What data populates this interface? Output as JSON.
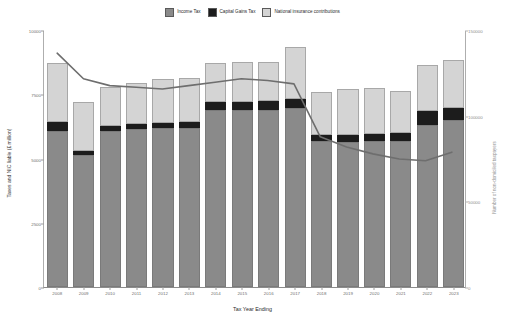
{
  "chart_data": {
    "type": "bar",
    "title": "",
    "subtitle": "",
    "xlabel": "Tax Year Ending",
    "ylabel": "Taxes and NIC liable (£ million)",
    "ylabel_right": "Number of non-domiciled taxpayers",
    "grid": false,
    "legend_position": "top-center",
    "categories": [
      "2008",
      "2009",
      "2010",
      "2011",
      "2012",
      "2013",
      "2014",
      "2015",
      "2016",
      "2017",
      "2018",
      "2019",
      "2020",
      "2021",
      "2022",
      "2023"
    ],
    "ylim": [
      0,
      10000
    ],
    "yticks": [
      0,
      2500,
      5000,
      7500,
      10000
    ],
    "ytick_labels": [
      "0",
      "2500",
      "5000",
      "7500",
      "10000"
    ],
    "ylim_right": [
      0,
      150000
    ],
    "yticks_right": [
      0,
      50000,
      100000,
      150000
    ],
    "ytick_labels_right": [
      "0",
      "50000",
      "100000",
      "150000"
    ],
    "series": [
      {
        "name": "Income Tax",
        "type": "bar",
        "stack": "taxes",
        "color": "#8a8a8a",
        "values": [
          6080,
          5120,
          6080,
          6150,
          6180,
          6200,
          6880,
          6900,
          6900,
          6950,
          5680,
          5650,
          5700,
          5700,
          6300,
          6480
        ]
      },
      {
        "name": "Capital Gains Tax",
        "type": "bar",
        "stack": "taxes",
        "color": "#1c1c1c",
        "values": [
          330,
          160,
          200,
          210,
          220,
          230,
          300,
          300,
          320,
          380,
          240,
          250,
          260,
          290,
          540,
          480
        ]
      },
      {
        "name": "National insurance contributions",
        "type": "bar",
        "stack": "taxes",
        "color": "#d4d4d4",
        "values": [
          2300,
          1920,
          1520,
          1580,
          1700,
          1700,
          1540,
          1550,
          1540,
          2000,
          1680,
          1800,
          1780,
          1650,
          1780,
          1880
        ]
      },
      {
        "name": "Number of non-domiciled taxpayers",
        "type": "line",
        "axis": "right",
        "color": "#6e6e6e",
        "values": [
          137000,
          122000,
          118000,
          117000,
          116000,
          118000,
          120000,
          122000,
          121000,
          119000,
          88000,
          82000,
          78000,
          75000,
          74000,
          79000
        ]
      }
    ],
    "legend": [
      {
        "label": "Income Tax",
        "color": "#8a8a8a"
      },
      {
        "label": "Capital Gains Tax",
        "color": "#1c1c1c"
      },
      {
        "label": "National insurance contributions",
        "color": "#d4d4d4"
      }
    ]
  }
}
